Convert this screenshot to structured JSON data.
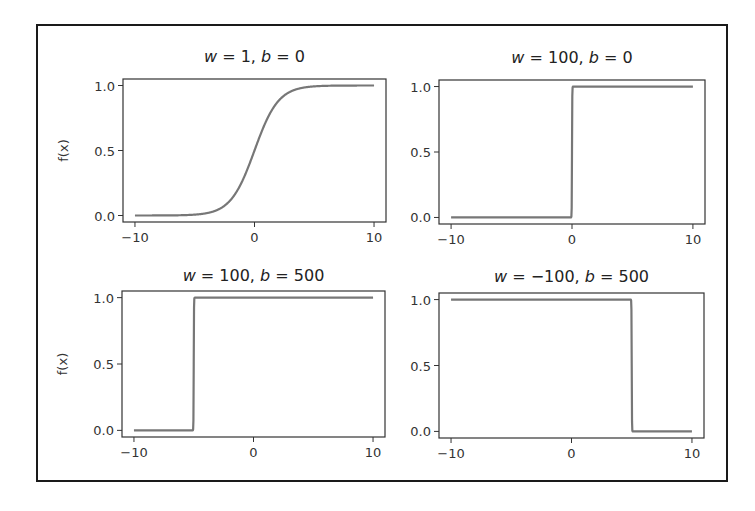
{
  "chart_data": [
    {
      "type": "line",
      "title": "w = 1, b = 0",
      "function": "sigmoid(w*x + b)",
      "w": 1,
      "b": 0,
      "xlabel": "",
      "ylabel": "f(x)",
      "xlim": [
        -11,
        11
      ],
      "ylim": [
        -0.05,
        1.05
      ],
      "xticks": [
        -10,
        0,
        10
      ],
      "xtick_labels": [
        "−10",
        "0",
        "10"
      ],
      "yticks": [
        0.0,
        0.5,
        1.0
      ],
      "ytick_labels": [
        "0.0",
        "0.5",
        "1.0"
      ],
      "x": [
        -10,
        -8,
        -6,
        -4,
        -3,
        -2,
        -1,
        0,
        1,
        2,
        3,
        4,
        6,
        8,
        10
      ],
      "y": [
        0.0,
        0.0003,
        0.0025,
        0.018,
        0.047,
        0.119,
        0.269,
        0.5,
        0.731,
        0.881,
        0.953,
        0.982,
        0.9975,
        0.9997,
        1.0
      ],
      "grid": false,
      "legend": null
    },
    {
      "type": "line",
      "title": "w = 100, b = 0",
      "function": "sigmoid(w*x + b)",
      "w": 100,
      "b": 0,
      "xlabel": "",
      "ylabel": "",
      "xlim": [
        -11,
        11
      ],
      "ylim": [
        -0.05,
        1.05
      ],
      "xticks": [
        -10,
        0,
        10
      ],
      "xtick_labels": [
        "−10",
        "0",
        "10"
      ],
      "yticks": [
        0.0,
        0.5,
        1.0
      ],
      "ytick_labels": [
        "0.0",
        "0.5",
        "1.0"
      ],
      "x": [
        -10,
        -0.05,
        0,
        0.05,
        10
      ],
      "y": [
        0,
        0.0067,
        0.5,
        0.9933,
        1
      ],
      "step_at": 0,
      "grid": false,
      "legend": null
    },
    {
      "type": "line",
      "title": "w = 100, b = 500",
      "function": "sigmoid(w*x + b)",
      "w": 100,
      "b": 500,
      "xlabel": "",
      "ylabel": "f(x)",
      "xlim": [
        -11,
        11
      ],
      "ylim": [
        -0.05,
        1.05
      ],
      "xticks": [
        -10,
        0,
        10
      ],
      "xtick_labels": [
        "−10",
        "0",
        "10"
      ],
      "yticks": [
        0.0,
        0.5,
        1.0
      ],
      "ytick_labels": [
        "0.0",
        "0.5",
        "1.0"
      ],
      "x": [
        -10,
        -5.05,
        -5,
        -4.95,
        10
      ],
      "y": [
        0,
        0.0067,
        0.5,
        0.9933,
        1
      ],
      "step_at": -5,
      "grid": false,
      "legend": null
    },
    {
      "type": "line",
      "title": "w = −100, b = 500",
      "function": "sigmoid(w*x + b)",
      "w": -100,
      "b": 500,
      "xlabel": "",
      "ylabel": "",
      "xlim": [
        -11,
        11
      ],
      "ylim": [
        -0.05,
        1.05
      ],
      "xticks": [
        -10,
        0,
        10
      ],
      "xtick_labels": [
        "−10",
        "0",
        "10"
      ],
      "yticks": [
        0.0,
        0.5,
        1.0
      ],
      "ytick_labels": [
        "0.0",
        "0.5",
        "1.0"
      ],
      "x": [
        -10,
        4.95,
        5,
        5.05,
        10
      ],
      "y": [
        1,
        0.9933,
        0.5,
        0.0067,
        0
      ],
      "step_at": 5,
      "grid": false,
      "legend": null
    }
  ],
  "panels": [
    {
      "title_w": "w",
      "title_rest": " = 1, ",
      "title_b": "b",
      "title_tail": " = 0",
      "ylabel": "f(x)"
    },
    {
      "title_w": "w",
      "title_rest": " = 100, ",
      "title_b": "b",
      "title_tail": " = 0",
      "ylabel": ""
    },
    {
      "title_w": "w",
      "title_rest": " = 100, ",
      "title_b": "b",
      "title_tail": " = 500",
      "ylabel": "f(x)"
    },
    {
      "title_w": "w",
      "title_rest": " = −100, ",
      "title_b": "b",
      "title_tail": " = 500",
      "ylabel": ""
    }
  ],
  "colors": {
    "curve": "#777777",
    "axes": "#333333",
    "frame": "#1a1a1a",
    "background": "#ffffff"
  }
}
